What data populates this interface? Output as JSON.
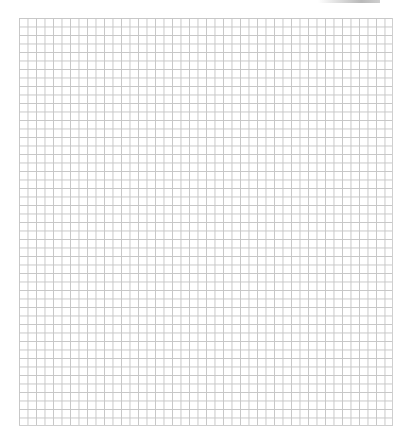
{
  "image": {
    "description": "Blank square graph paper grid",
    "grid": {
      "columns": 44,
      "rows": 48,
      "cell_size_px": 8.5,
      "line_color": "#c6c6c6",
      "background_color": "#ffffff"
    },
    "top_shade_color": "#b9b9b9"
  }
}
